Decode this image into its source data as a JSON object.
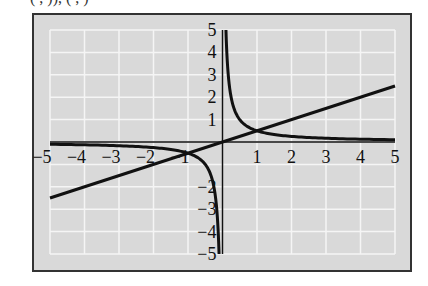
{
  "caption_fragment": "(  ,  )), (  ,  )",
  "colors": {
    "frame_fill": "#d9d9d9",
    "frame_border": "#333333",
    "grid": "#f5f5f5",
    "curve": "#111111",
    "axis": "#111111"
  },
  "chart_data": {
    "type": "line",
    "title": "",
    "xlabel": "",
    "ylabel": "",
    "xlim": [
      -5,
      5
    ],
    "ylim": [
      -5,
      5
    ],
    "grid": true,
    "x_ticks": [
      -5,
      -4,
      -3,
      -2,
      -1,
      1,
      2,
      3,
      4,
      5
    ],
    "x_tick_labels": [
      "−5",
      "−4",
      "−3",
      "−2",
      "−1",
      "1",
      "2",
      "3",
      "4",
      "5"
    ],
    "y_ticks": [
      5,
      4,
      3,
      2,
      1,
      -2,
      -3,
      -4,
      -5
    ],
    "y_tick_labels": [
      "5",
      "4",
      "3",
      "2",
      "1",
      "−2",
      "−3",
      "−4",
      "−5"
    ],
    "series": [
      {
        "name": "line y = 0.5x",
        "kind": "line",
        "x": [
          -5,
          5
        ],
        "y": [
          -2.5,
          2.5
        ]
      },
      {
        "name": "hyperbola y = 0.5/x",
        "kind": "hyperbola",
        "k": 0.5,
        "x_range_pos": [
          0.1,
          5
        ],
        "x_range_neg": [
          -5,
          -0.1
        ]
      }
    ],
    "annotations": [
      {
        "type": "intersection",
        "x": 1,
        "y": 0.5
      },
      {
        "type": "intersection",
        "x": -1,
        "y": -0.5
      }
    ]
  }
}
